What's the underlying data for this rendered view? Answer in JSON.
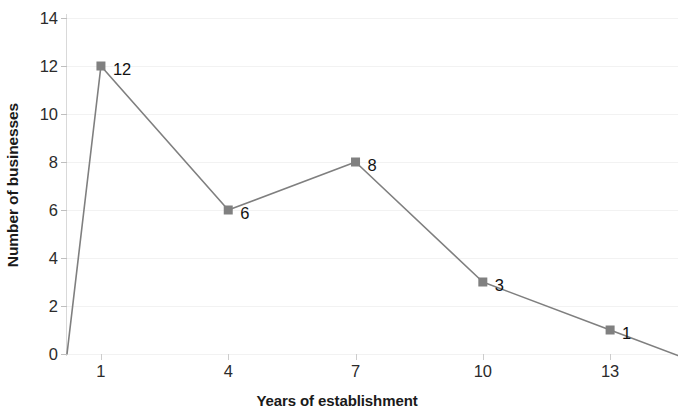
{
  "chart_data": {
    "type": "line",
    "title": "",
    "xlabel": "Years of establishment",
    "ylabel": "Number of businesses",
    "x": [
      1,
      4,
      7,
      10,
      13
    ],
    "values": [
      12,
      6,
      8,
      3,
      1
    ],
    "point_labels": [
      "12",
      "6",
      "8",
      "3",
      "1"
    ],
    "xlim": [
      0.2,
      14.6
    ],
    "ylim": [
      0,
      14
    ],
    "x_ticks": [
      1,
      4,
      7,
      10,
      13
    ],
    "x_tick_labels": [
      "1",
      "4",
      "7",
      "10",
      "13"
    ],
    "y_ticks": [
      0,
      2,
      4,
      6,
      8,
      10,
      12,
      14
    ],
    "y_tick_labels": [
      "0",
      "2",
      "4",
      "6",
      "8",
      "10",
      "12",
      "14"
    ],
    "grid": true,
    "legend": false,
    "line_color": "#7f7f7f",
    "marker_color": "#808080",
    "marker_shape": "square",
    "label_color": "#111111",
    "grid_color": "#f2f2f2",
    "axis_color": "#d9d9d9",
    "background_color": "#ffffff",
    "line_extends_to_baseline_left": true,
    "line_extends_past_last_point": true
  }
}
